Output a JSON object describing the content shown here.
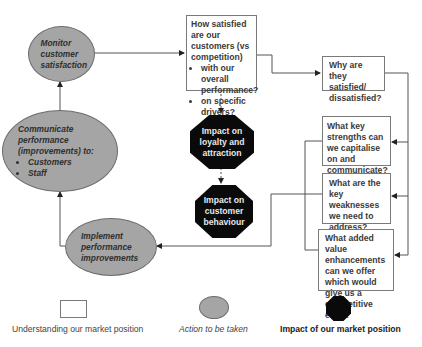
{
  "diagram": {
    "nodes": {
      "how_satisfied": {
        "title": "How satisfied are our customers (vs competition)",
        "bullets": [
          "with our overall performance?",
          "on specific drivers?"
        ]
      },
      "why": {
        "text": "Why are they satisfied/ dissatisfied?"
      },
      "strengths": {
        "text": "What key strengths can we capitalise on and communicate?"
      },
      "weaknesses": {
        "text": "What are the key weaknesses we need to address?"
      },
      "added_value": {
        "text": "What added value enhancements can we offer which would give us a competitive edge?"
      },
      "monitor": {
        "text": "Monitor customer satisfaction"
      },
      "communicate": {
        "title": "Communicate performance (improvements) to:",
        "bullets": [
          "Customers",
          "Staff"
        ]
      },
      "implement": {
        "text": "Implement performance improvements"
      },
      "impact_loyalty": {
        "text": "Impact on loyalty and attraction"
      },
      "impact_behaviour": {
        "text": "Impact on customer behaviour"
      }
    },
    "legend": {
      "rectangle": "Understanding our market position",
      "ellipse": "Action to be taken",
      "octagon": "Impact of our market position"
    },
    "colors": {
      "ellipse_fill": "#a5a5a5",
      "octagon_fill": "#0a0a0a",
      "box_border": "#7a7a7a",
      "line": "#555555"
    }
  }
}
